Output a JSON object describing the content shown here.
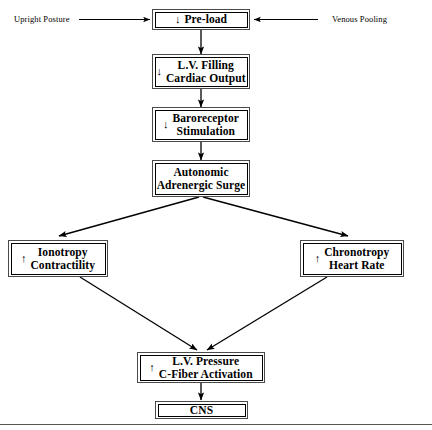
{
  "diagram": {
    "inputs": [
      {
        "id": "upright-posture",
        "label": "Upright Posture",
        "arrow": "right"
      },
      {
        "id": "venous-pooling",
        "label": "Venous Pooling",
        "arrow": "left"
      }
    ],
    "nodes": [
      {
        "id": "pre-load",
        "symbol": "↓",
        "line1": "Pre-load",
        "line2": ""
      },
      {
        "id": "lv-filling",
        "symbol": "↓",
        "line1": "L.V. Filling",
        "line2": "Cardiac Output"
      },
      {
        "id": "baroreceptor",
        "symbol": "↓",
        "line1": "Baroreceptor",
        "line2": "Stimulation"
      },
      {
        "id": "autonomic-surge",
        "symbol": "",
        "line1": "Autonomic",
        "line2": "Adrenergic Surge"
      },
      {
        "id": "ionotropy",
        "symbol": "↑",
        "line1": "Ionotropy",
        "line2": "Contractility"
      },
      {
        "id": "chronotropy",
        "symbol": "↑",
        "line1": "Chronotropy",
        "line2": "Heart Rate"
      },
      {
        "id": "lv-pressure",
        "symbol": "↑",
        "line1": "L.V. Pressure",
        "line2": "C-Fiber Activation"
      },
      {
        "id": "cns",
        "symbol": "",
        "line1": "CNS",
        "line2": ""
      }
    ],
    "colors": {
      "ink": "#000000",
      "box_outer": "#4a4a4a",
      "box_inner": "#000000",
      "paper": "#ffffff",
      "rule": "#555555"
    }
  }
}
